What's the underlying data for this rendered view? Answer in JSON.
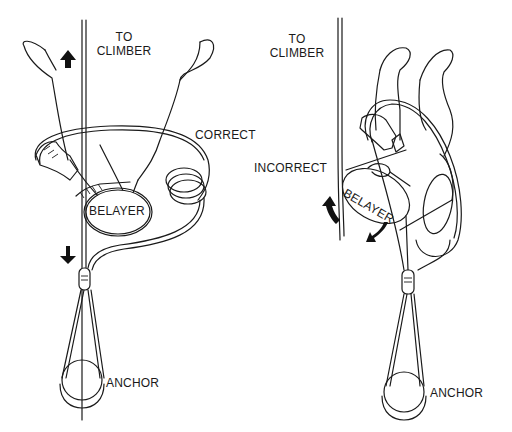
{
  "diagram": {
    "panels": [
      {
        "id": "correct",
        "labels": {
          "to_climber": "TO\nCLIMBER",
          "to_climber_line1": "TO",
          "to_climber_line2": "CLIMBER",
          "status": "CORRECT",
          "belayer": "BELAYER",
          "anchor": "ANCHOR"
        },
        "arrows": [
          "up-arrow",
          "down-arrow"
        ]
      },
      {
        "id": "incorrect",
        "labels": {
          "to_climber_line1": "TO",
          "to_climber_line2": "CLIMBER",
          "status": "INCORRECT",
          "belayer": "BELAYER",
          "anchor": "ANCHOR"
        },
        "arrows": [
          "rotate-left-arrow",
          "rotate-right-arrow"
        ]
      }
    ],
    "colors": {
      "ink": "#1a1a1a",
      "background": "#ffffff"
    }
  }
}
